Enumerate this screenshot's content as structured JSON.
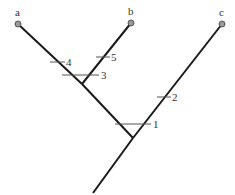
{
  "diagram": {
    "type": "phylogenetic-tree",
    "taxa": [
      {
        "id": "a",
        "label": "a"
      },
      {
        "id": "b",
        "label": "b"
      },
      {
        "id": "c",
        "label": "c"
      }
    ],
    "character_marks": [
      {
        "label": "1",
        "branch": "ab-clade"
      },
      {
        "label": "2",
        "branch": "c"
      },
      {
        "label": "3",
        "branch": "b-node"
      },
      {
        "label": "4",
        "branch": "a"
      },
      {
        "label": "5",
        "branch": "b"
      }
    ],
    "colors": {
      "branch": "#1a1a1a",
      "tip": "#999999",
      "tick": "#555555",
      "text": "#333333"
    }
  }
}
